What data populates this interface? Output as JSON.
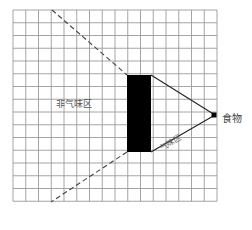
{
  "diagram": {
    "grid": {
      "left": 13,
      "top": 10,
      "cols": 16,
      "rows": 15,
      "cell": 12.75,
      "color": "#9a9a9a"
    },
    "labels": {
      "non_odor_zone": "非气味区",
      "odor_zone": "气味区",
      "food": "食物"
    },
    "obstacle": {
      "x": 127,
      "y": 75,
      "w": 24,
      "h": 77,
      "color": "#000000"
    },
    "food_point": {
      "x": 213,
      "y": 115,
      "size": 5,
      "color": "#000000"
    },
    "lines": {
      "dashed": [
        {
          "x1": 52,
          "y1": 10,
          "x2": 127,
          "y2": 75
        },
        {
          "x1": 127,
          "y1": 152,
          "x2": 51,
          "y2": 202
        }
      ],
      "solid": [
        {
          "x1": 151,
          "y1": 75,
          "x2": 215,
          "y2": 115
        },
        {
          "x1": 151,
          "y1": 152,
          "x2": 215,
          "y2": 115
        }
      ]
    }
  }
}
